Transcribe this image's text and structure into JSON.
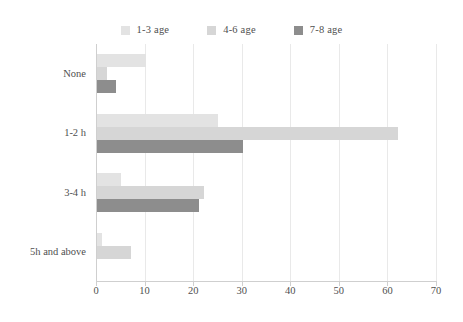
{
  "chart_data": {
    "type": "bar",
    "orientation": "horizontal",
    "title": "",
    "xlabel": "",
    "ylabel": "",
    "categories": [
      "None",
      "1-2 h",
      "3-4 h",
      "5h and above"
    ],
    "series": [
      {
        "name": "1-3 age",
        "color": "#e3e3e3",
        "values": [
          10,
          25,
          5,
          1
        ]
      },
      {
        "name": "4-6 age",
        "color": "#d6d6d6",
        "values": [
          2,
          62,
          22,
          7
        ]
      },
      {
        "name": "7-8 age",
        "color": "#8d8d8d",
        "values": [
          4,
          30,
          21,
          0
        ]
      }
    ],
    "xlim": [
      0,
      70
    ],
    "xticks": [
      0,
      10,
      20,
      30,
      40,
      50,
      60,
      70
    ],
    "xtick_labels": [
      "0",
      "10",
      "20",
      "30",
      "40",
      "50",
      "60",
      "70"
    ],
    "grid": "vertical",
    "legend_position": "top-center"
  },
  "legend": {
    "items": [
      {
        "label": "1-3 age",
        "swatch": "legend-swatch-1-3-age"
      },
      {
        "label": "4-6 age",
        "swatch": "legend-swatch-4-6-age"
      },
      {
        "label": "7-8 age",
        "swatch": "legend-swatch-7-8-age"
      }
    ]
  },
  "axes": {
    "y_categories": [
      "None",
      "1-2 h",
      "3-4 h",
      "5h and above"
    ],
    "x_ticks": [
      "0",
      "10",
      "20",
      "30",
      "40",
      "50",
      "60",
      "70"
    ]
  },
  "colors": {
    "series_1": "#e3e3e3",
    "series_2": "#d6d6d6",
    "series_3": "#8d8d8d",
    "grid": "#e9e9e9",
    "axis": "#cfcfcf",
    "text": "#4f4f4f",
    "background": "#ffffff"
  }
}
